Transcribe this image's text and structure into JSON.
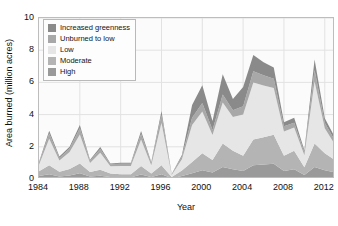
{
  "chart_data": {
    "type": "area",
    "stacked": true,
    "title": "",
    "xlabel": "Year",
    "ylabel": "Area burned (million acres)",
    "xlim": [
      1984,
      2013
    ],
    "ylim": [
      0,
      10
    ],
    "xticks": [
      1984,
      1988,
      1992,
      1996,
      2000,
      2004,
      2008,
      2012
    ],
    "yticks": [
      0,
      2,
      4,
      6,
      8,
      10
    ],
    "grid": true,
    "legend_position": "upper-left",
    "x": [
      1984,
      1985,
      1986,
      1987,
      1988,
      1989,
      1990,
      1991,
      1992,
      1993,
      1994,
      1995,
      1996,
      1997,
      1998,
      1999,
      2000,
      2001,
      2002,
      2003,
      2004,
      2005,
      2006,
      2007,
      2008,
      2009,
      2010,
      2011,
      2012,
      2013
    ],
    "series": [
      {
        "name": "High",
        "color": "#9a9a9a",
        "stack_order": 1,
        "values": [
          0.18,
          0.3,
          0.15,
          0.22,
          0.35,
          0.16,
          0.2,
          0.12,
          0.1,
          0.1,
          0.28,
          0.12,
          0.3,
          0.05,
          0.18,
          0.35,
          0.55,
          0.4,
          0.75,
          0.6,
          0.5,
          0.85,
          0.9,
          0.95,
          0.5,
          0.6,
          0.25,
          0.75,
          0.55,
          0.4
        ]
      },
      {
        "name": "Moderate",
        "color": "#b4b4b4",
        "stack_order": 2,
        "values": [
          0.3,
          0.55,
          0.3,
          0.4,
          0.62,
          0.28,
          0.38,
          0.22,
          0.2,
          0.2,
          0.52,
          0.22,
          0.55,
          0.08,
          0.35,
          0.7,
          1.05,
          0.78,
          1.45,
          1.15,
          0.95,
          1.6,
          1.7,
          1.8,
          0.95,
          1.15,
          0.48,
          1.45,
          1.05,
          0.78
        ]
      },
      {
        "name": "Low",
        "color": "#e6e6e6",
        "stack_order": 3,
        "values": [
          0.4,
          1.65,
          0.7,
          1.05,
          1.8,
          0.55,
          1.05,
          0.45,
          0.5,
          0.5,
          1.65,
          0.52,
          2.65,
          0.12,
          0.7,
          2.3,
          2.6,
          1.55,
          2.55,
          2.1,
          2.55,
          3.55,
          3.2,
          2.9,
          1.5,
          1.45,
          0.75,
          3.85,
          1.55,
          0.95
        ]
      },
      {
        "name": "Unburned to low",
        "color": "#a8a8a8",
        "stack_order": 4,
        "values": [
          0.12,
          0.32,
          0.16,
          0.22,
          0.38,
          0.14,
          0.24,
          0.12,
          0.14,
          0.14,
          0.35,
          0.14,
          0.48,
          0.04,
          0.16,
          0.45,
          0.52,
          0.32,
          0.5,
          0.42,
          0.52,
          0.7,
          0.65,
          0.58,
          0.32,
          0.3,
          0.18,
          0.72,
          0.34,
          0.24
        ]
      },
      {
        "name": "Increased greenness",
        "color": "#8a8a8a",
        "stack_order": 5,
        "values": [
          0.05,
          0.18,
          0.08,
          0.12,
          0.2,
          0.07,
          0.12,
          0.06,
          0.07,
          0.07,
          0.18,
          0.06,
          0.25,
          0.02,
          0.1,
          0.8,
          1.1,
          0.55,
          1.25,
          0.7,
          1.2,
          1.0,
          0.8,
          0.7,
          0.25,
          0.3,
          0.12,
          0.65,
          0.28,
          0.2
        ]
      }
    ],
    "legend": [
      {
        "label": "Increased greenness",
        "color": "#8a8a8a"
      },
      {
        "label": "Unburned to low",
        "color": "#a8a8a8"
      },
      {
        "label": "Low",
        "color": "#e6e6e6"
      },
      {
        "label": "Moderate",
        "color": "#b4b4b4"
      },
      {
        "label": "High",
        "color": "#9a9a9a"
      }
    ]
  }
}
